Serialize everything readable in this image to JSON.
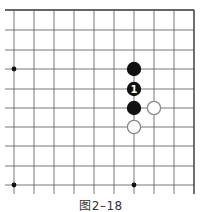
{
  "figure": {
    "caption": "图2–18",
    "grid": {
      "x_lines": [
        14,
        34,
        54,
        74,
        94,
        114,
        134,
        154,
        174,
        194
      ],
      "y_lines": [
        10,
        30,
        50,
        69,
        89,
        108,
        127,
        146,
        166,
        185
      ],
      "left_extend": 5,
      "bottom_extend": 194,
      "top_edge": true,
      "right_edge": true
    },
    "star_points": [
      {
        "x": 14,
        "y": 69
      },
      {
        "x": 14,
        "y": 185
      },
      {
        "x": 134,
        "y": 185
      }
    ],
    "stones": [
      {
        "color": "black",
        "x": 134,
        "y": 69,
        "label": ""
      },
      {
        "color": "black",
        "x": 134,
        "y": 89,
        "label": "1"
      },
      {
        "color": "black",
        "x": 134,
        "y": 108,
        "label": ""
      },
      {
        "color": "white",
        "x": 154,
        "y": 108,
        "label": ""
      },
      {
        "color": "white",
        "x": 134,
        "y": 127,
        "label": ""
      }
    ],
    "colors": {
      "line": "#555555",
      "edge": "#333333",
      "black_stone": "#111111",
      "white_stone_stroke": "#888888",
      "label": "#ffffff"
    }
  }
}
